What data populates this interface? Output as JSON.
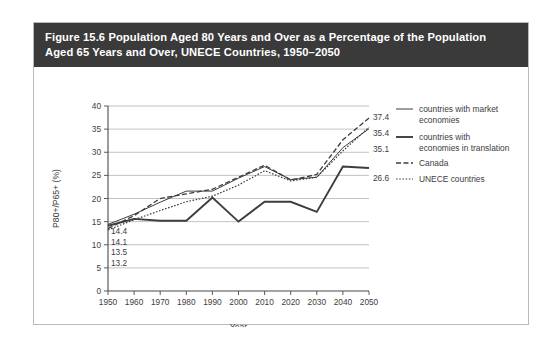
{
  "figure": {
    "title": "Figure 15.6 Population Aged 80 Years and Over as a Percentage of the Population Aged 65 Years and Over, UNECE Countries, 1950–2050"
  },
  "chart_data": {
    "type": "line",
    "title": "",
    "xlabel": "Year",
    "ylabel": "P80+/P65+ (%)",
    "x": [
      1950,
      1960,
      1970,
      1980,
      1990,
      2000,
      2010,
      2020,
      2030,
      2040,
      2050
    ],
    "categories": [
      "1950",
      "1960",
      "1970",
      "1980",
      "1990",
      "2000",
      "2010",
      "2020",
      "2030",
      "2040",
      "2050"
    ],
    "xlim": [
      1950,
      2050
    ],
    "ylim": [
      0,
      40
    ],
    "yticks": [
      0,
      5,
      10,
      15,
      20,
      25,
      30,
      35,
      40
    ],
    "grid": true,
    "legend_position": "right",
    "series": [
      {
        "name": "countries with market economies",
        "style": "solid-thin",
        "start_label": "14.4",
        "end_label": "35.1",
        "values": [
          14.4,
          16.6,
          19.2,
          21.6,
          21.6,
          24.4,
          26.9,
          24.1,
          24.6,
          31.0,
          35.1
        ]
      },
      {
        "name": "countries with economies in translation",
        "style": "solid-thick",
        "start_label": "14.1",
        "end_label": "26.6",
        "values": [
          14.1,
          15.6,
          15.2,
          15.2,
          20.2,
          15.0,
          19.3,
          19.3,
          17.1,
          26.9,
          26.6
        ]
      },
      {
        "name": "Canada",
        "style": "dashed",
        "start_label": "13.5",
        "end_label": "37.4",
        "values": [
          13.5,
          16.3,
          20.0,
          21.0,
          22.0,
          24.6,
          27.2,
          24.0,
          25.2,
          32.7,
          37.4
        ]
      },
      {
        "name": "UNECE countries",
        "style": "dotted",
        "start_label": "13.2",
        "end_label": "35.4",
        "values": [
          13.2,
          15.4,
          17.4,
          19.3,
          20.5,
          22.9,
          26.0,
          23.8,
          24.6,
          30.3,
          35.4
        ]
      }
    ],
    "left_labels": [
      "14.4",
      "14.1",
      "13.5",
      "13.2"
    ],
    "right_labels": [
      "37.4",
      "35.4",
      "35.1",
      "26.6"
    ]
  }
}
